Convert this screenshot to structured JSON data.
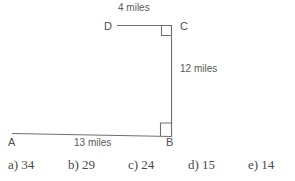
{
  "figure": {
    "type": "geometry-diagram",
    "stroke_color": "#6e6e6e",
    "background": "#ffffff",
    "vertices": [
      {
        "name": "A",
        "label": "A",
        "x": 12,
        "y": 135
      },
      {
        "name": "B",
        "label": "B",
        "x": 171,
        "y": 136
      },
      {
        "name": "C",
        "label": "C",
        "x": 171,
        "y": 26
      },
      {
        "name": "D",
        "label": "D",
        "x": 117,
        "y": 26
      }
    ],
    "segments": [
      {
        "name": "segment-DC",
        "from": "D",
        "to": "C",
        "label": "4 miles"
      },
      {
        "name": "segment-CB",
        "from": "C",
        "to": "B",
        "label": "12 miles"
      },
      {
        "name": "segment-AB",
        "from": "A",
        "to": "B",
        "label": "13 miles"
      }
    ],
    "right_angles": [
      {
        "name": "right-angle-at-C",
        "at": "C"
      },
      {
        "name": "right-angle-at-B",
        "at": "B"
      }
    ],
    "labels": {
      "top_length": "4 miles",
      "right_length": "12 miles",
      "bottom_length": "13 miles"
    }
  },
  "answers": {
    "choices": [
      {
        "key": "a)",
        "value": "34",
        "text": "a) 34",
        "x": 8
      },
      {
        "key": "b)",
        "value": "29",
        "text": "b) 29",
        "x": 68
      },
      {
        "key": "c)",
        "value": "24",
        "text": "c) 24",
        "x": 128
      },
      {
        "key": "d)",
        "value": "15",
        "text": "d) 15",
        "x": 188
      },
      {
        "key": "e)",
        "value": "14",
        "text": "e) 14",
        "x": 248
      }
    ]
  }
}
